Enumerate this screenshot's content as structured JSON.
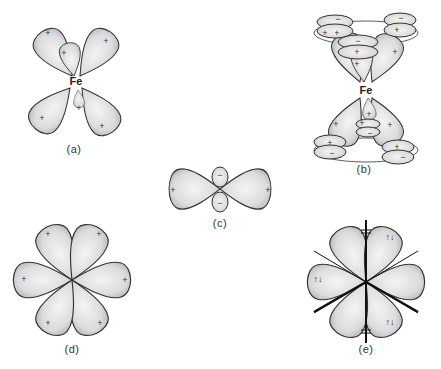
{
  "figure": {
    "panels": [
      {
        "id": "a",
        "label": "(a)",
        "center_atom": "Fe",
        "description": "octahedral-like set of d-orbital lobes around Fe, all positive"
      },
      {
        "id": "b",
        "label": "(b)",
        "center_atom": "Fe",
        "description": "Fe sandwiched between two rings of p-orbitals (ferrocene-like), lobes with + and − signs"
      },
      {
        "id": "c",
        "label": "(c)",
        "description": "dz2-like orbital: two large + lobes horizontal, small − lobes above and below"
      },
      {
        "id": "d",
        "label": "(d)",
        "description": "six-lobed (hexagonal) arrangement, all lobes +"
      },
      {
        "id": "e",
        "label": "(e)",
        "description": "six-lobed arrangement with axes and electron-pair arrows (↑↓) in lobes"
      }
    ],
    "signs": {
      "plus": "+",
      "minus": "−",
      "electron_pair": "↑↓"
    },
    "atom_label": "Fe"
  },
  "colors": {
    "background": "#ffffff",
    "lobe_fill": "#e8e8e8",
    "lobe_stroke": "#333333",
    "text": "#222222"
  }
}
